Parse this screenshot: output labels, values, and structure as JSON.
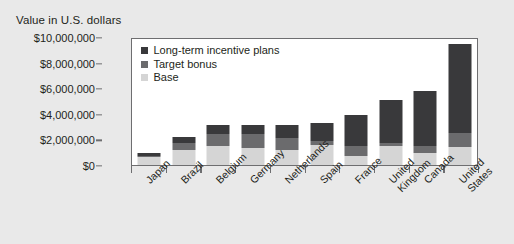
{
  "chart_data": {
    "type": "bar",
    "subtype": "stacked-bar",
    "title": "",
    "ylabel": "Value in U.S. dollars",
    "xlabel": "",
    "ylim": [
      0,
      10000000
    ],
    "ytick_values": [
      0,
      2000000,
      4000000,
      6000000,
      8000000,
      10000000
    ],
    "ytick_labels": [
      "$0",
      "$2,000,000",
      "$4,000,000",
      "$6,000,000",
      "$8,000,000",
      "$10,000,000"
    ],
    "grid": false,
    "legend_position": "upper-left-inside",
    "categories": [
      "Japan",
      "Brazil",
      "Belgium",
      "Germany",
      "Netherlands",
      "Spain",
      "France",
      "United Kingdom",
      "Canada",
      "United States"
    ],
    "series": [
      {
        "name": "Base",
        "color": "#d5d5d5",
        "values": [
          600000,
          1200000,
          1500000,
          1300000,
          1200000,
          1600000,
          700000,
          1500000,
          900000,
          1400000
        ]
      },
      {
        "name": "Target bonus",
        "color": "#6b6b6d",
        "values": [
          100000,
          500000,
          900000,
          1100000,
          900000,
          300000,
          800000,
          200000,
          600000,
          1100000
        ]
      },
      {
        "name": "Long-term incentive plans",
        "color": "#39393b",
        "values": [
          250000,
          500000,
          700000,
          700000,
          1000000,
          1400000,
          2400000,
          3400000,
          4300000,
          6950000
        ]
      }
    ],
    "totals": [
      950000,
      2200000,
      3100000,
      3100000,
      3100000,
      3300000,
      3900000,
      5100000,
      5800000,
      9450000
    ]
  },
  "legend": {
    "items": [
      {
        "label": "Long-term incentive plans",
        "color": "#39393b"
      },
      {
        "label": "Target bonus",
        "color": "#6b6b6d"
      },
      {
        "label": "Base",
        "color": "#d5d5d5"
      }
    ]
  },
  "colors": {
    "background": "#e9e9e9",
    "plot_background": "#ffffff",
    "axis": "#6e6e70",
    "text": "#231f20"
  }
}
